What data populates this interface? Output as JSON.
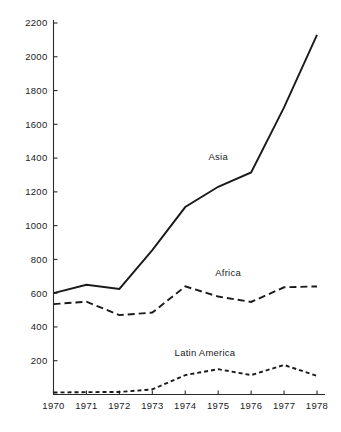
{
  "chart_data": {
    "type": "line",
    "title": "",
    "subtitle": "",
    "xlabel": "",
    "ylabel": "",
    "x": [
      1970,
      1971,
      1972,
      1973,
      1974,
      1975,
      1976,
      1977,
      1978
    ],
    "categories": [
      "1970",
      "1971",
      "1972",
      "1973",
      "1974",
      "1975",
      "1976",
      "1977",
      "1978"
    ],
    "xlim": [
      1970,
      1978
    ],
    "ylim": [
      0,
      2200
    ],
    "y_ticks": [
      200,
      400,
      600,
      800,
      1000,
      1200,
      1400,
      1600,
      1800,
      2000,
      2200
    ],
    "y_tick_labels": [
      "200",
      "400",
      "600",
      "800",
      "1000",
      "1200",
      "1400",
      "1600",
      "1800",
      "2000",
      "2200"
    ],
    "x_ticks": [
      1970,
      1971,
      1972,
      1973,
      1974,
      1975,
      1976,
      1977,
      1978
    ],
    "x_tick_labels": [
      "1970",
      "1971",
      "1972",
      "1973",
      "1974",
      "1975",
      "1976",
      "1977",
      "1978"
    ],
    "grid": false,
    "legend_position": "inline-annotations",
    "series": [
      {
        "name": "Asia",
        "style": "solid",
        "color": "#1a1a1a",
        "label_x": 1975.0,
        "label_y": 1390,
        "values": [
          600,
          650,
          625,
          855,
          1110,
          1230,
          1315,
          1700,
          2130
        ]
      },
      {
        "name": "Africa",
        "style": "dashed",
        "color": "#1a1a1a",
        "label_x": 1975.3,
        "label_y": 700,
        "values": [
          535,
          550,
          470,
          485,
          640,
          580,
          548,
          635,
          640
        ]
      },
      {
        "name": "Latin America",
        "style": "dotted-dash",
        "color": "#1a1a1a",
        "label_x": 1974.6,
        "label_y": 228,
        "values": [
          12,
          14,
          15,
          30,
          115,
          150,
          115,
          175,
          110
        ]
      }
    ],
    "annotations": [
      {
        "text": "Asia",
        "x": 1975.0,
        "y": 1390
      },
      {
        "text": "Africa",
        "x": 1975.3,
        "y": 700
      },
      {
        "text": "Latin America",
        "x": 1974.6,
        "y": 228
      }
    ]
  }
}
